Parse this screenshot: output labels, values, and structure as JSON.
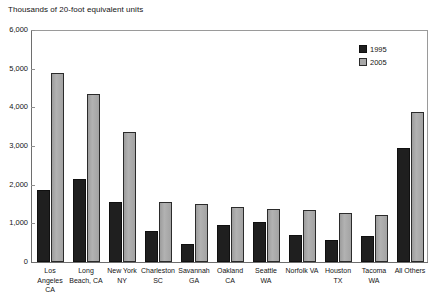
{
  "chart_data": {
    "type": "bar",
    "title": "Thousands of 20-foot equivalent units",
    "xlabel": "",
    "ylabel": "",
    "ylim": [
      0,
      6000
    ],
    "ytick_labels": [
      "0",
      "1,000",
      "2,000",
      "3,000",
      "4,000",
      "5,000",
      "6,000"
    ],
    "ytick_values": [
      0,
      1000,
      2000,
      3000,
      4000,
      5000,
      6000
    ],
    "grid": false,
    "legend_position": "top-right",
    "categories": [
      "Los Angeles CA",
      "Long Beach, CA",
      "New York NY",
      "Charleston SC",
      "Savannah GA",
      "Oakland CA",
      "Seattle WA",
      "Norfolk VA",
      "Houston TX",
      "Tacoma WA",
      "All Others"
    ],
    "category_label_lines": [
      [
        "Los",
        "Angeles",
        "CA"
      ],
      [
        "Long",
        "Beach, CA"
      ],
      [
        "New York",
        "NY"
      ],
      [
        "Charleston",
        "SC"
      ],
      [
        "Savannah",
        "GA"
      ],
      [
        "Oakland",
        "CA"
      ],
      [
        "Seattle",
        "WA"
      ],
      [
        "Norfolk VA"
      ],
      [
        "Houston",
        "TX"
      ],
      [
        "Tacoma",
        "WA"
      ],
      [
        "All Others"
      ]
    ],
    "series": [
      {
        "name": "1995",
        "color": "#1f1f1f",
        "values": [
          1870,
          2150,
          1560,
          800,
          460,
          950,
          1030,
          700,
          570,
          660,
          2950
        ]
      },
      {
        "name": "2005",
        "color": "#a8a8a8",
        "values": [
          4890,
          4350,
          3370,
          1550,
          1500,
          1420,
          1380,
          1350,
          1270,
          1210,
          3890
        ]
      }
    ]
  }
}
